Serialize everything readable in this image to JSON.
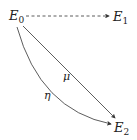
{
  "nodes": {
    "e0": {
      "main": "E",
      "sub": "0"
    },
    "e1": {
      "main": "E",
      "sub": "1"
    },
    "e2": {
      "main": "E",
      "sub": "2"
    }
  },
  "edges": {
    "e0_e1": {
      "label": "",
      "style": "dashed"
    },
    "e0_e2_straight": {
      "label": "μ",
      "style": "solid"
    },
    "e0_e2_curved": {
      "label": "η",
      "style": "solid"
    }
  },
  "colors": {
    "stroke": "#333333",
    "text": "#222222"
  }
}
